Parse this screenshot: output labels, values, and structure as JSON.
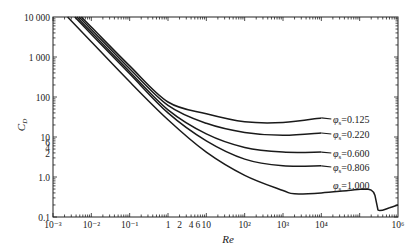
{
  "chart_data": {
    "type": "line",
    "title": "",
    "xlabel": "Re",
    "ylabel": "C_D",
    "xscale": "log",
    "yscale": "log",
    "xlim": [
      0.001,
      1000000
    ],
    "ylim": [
      0.1,
      10000
    ],
    "grid": false,
    "legend_position": "inline labels at right end of curves",
    "x_tick_labels": [
      {
        "value": 0.001,
        "label": "10⁻³"
      },
      {
        "value": 0.01,
        "label": "10⁻²"
      },
      {
        "value": 0.1,
        "label": "10⁻¹"
      },
      {
        "value": 1,
        "label": "1"
      },
      {
        "value": 2,
        "label": "2"
      },
      {
        "value": 4,
        "label": "4"
      },
      {
        "value": 6,
        "label": "6"
      },
      {
        "value": 10,
        "label": "10"
      },
      {
        "value": 100,
        "label": "10²"
      },
      {
        "value": 1000,
        "label": "10³"
      },
      {
        "value": 10000,
        "label": "10⁴"
      },
      {
        "value": 1000000,
        "label": "10⁶"
      }
    ],
    "y_tick_labels": [
      {
        "value": 10000,
        "label": "10 000"
      },
      {
        "value": 1000,
        "label": "1 000"
      },
      {
        "value": 100,
        "label": "100"
      },
      {
        "value": 10,
        "label": "10"
      },
      {
        "value": 6,
        "label": "6"
      },
      {
        "value": 4,
        "label": "4"
      },
      {
        "value": 2,
        "label": "2"
      },
      {
        "value": 1,
        "label": "1.0"
      },
      {
        "value": 0.1,
        "label": "0.1"
      }
    ],
    "series": [
      {
        "name": "φs=0.125",
        "label": "φs=0.125",
        "x": [
          0.0055,
          0.01,
          0.1,
          1,
          10,
          100,
          1000,
          10000
        ],
        "y": [
          10000,
          5600,
          600,
          75,
          38,
          24,
          23,
          30
        ]
      },
      {
        "name": "φs=0.220",
        "label": "φs=0.220",
        "x": [
          0.0048,
          0.01,
          0.1,
          1,
          10,
          100,
          1000,
          10000
        ],
        "y": [
          10000,
          4900,
          510,
          62,
          22,
          13,
          11,
          12.6
        ]
      },
      {
        "name": "φs=0.600",
        "label": "φs=0.600",
        "x": [
          0.0042,
          0.01,
          0.1,
          1,
          10,
          100,
          1000,
          10000
        ],
        "y": [
          10000,
          4200,
          430,
          48,
          12,
          5.5,
          4.2,
          4.2
        ]
      },
      {
        "name": "φs=0.806",
        "label": "φs=0.806",
        "x": [
          0.0037,
          0.01,
          0.1,
          1,
          10,
          100,
          1000,
          10000
        ],
        "y": [
          10000,
          3700,
          380,
          40,
          8,
          2.8,
          1.9,
          1.9
        ]
      },
      {
        "name": "φs=1.000",
        "label": "φs=1.000",
        "x": [
          0.0024,
          0.01,
          0.1,
          1,
          10,
          100,
          1000,
          2000,
          10000,
          50000,
          130000,
          200000,
          250000,
          300000,
          600000,
          1000000
        ],
        "y": [
          10000,
          2400,
          240,
          27,
          4.2,
          1.1,
          0.46,
          0.38,
          0.4,
          0.46,
          0.5,
          0.47,
          0.35,
          0.15,
          0.17,
          0.2
        ]
      }
    ],
    "annotations": [
      {
        "text": "φs=0.125",
        "x": 12000,
        "y": 30
      },
      {
        "text": "φs=0.220",
        "x": 12000,
        "y": 12.6
      },
      {
        "text": "φs=0.600",
        "x": 12000,
        "y": 4.2
      },
      {
        "text": "φs=0.806",
        "x": 12000,
        "y": 1.9
      },
      {
        "text": "φs=1.000",
        "x": 12000,
        "y": 0.62
      }
    ]
  },
  "labels": {
    "xlabel": "Re",
    "ylabel_main": "C",
    "ylabel_sub": "D",
    "series_prefix": "φ",
    "series_sub": "s",
    "series_values": [
      "=0.125",
      "=0.220",
      "=0.600",
      "=0.806",
      "=1.000"
    ]
  }
}
